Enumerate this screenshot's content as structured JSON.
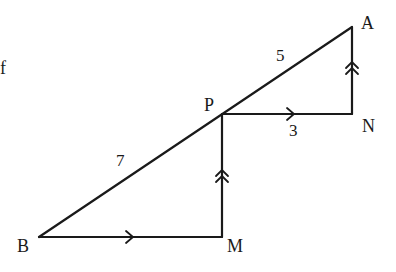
{
  "diagram": {
    "type": "geometry",
    "stroke_color": "#1a1a1a",
    "background": "#ffffff",
    "fragment_text": "f",
    "points": {
      "A": {
        "label": "A",
        "x": 352,
        "y": 27
      },
      "N": {
        "label": "N",
        "x": 352,
        "y": 114
      },
      "P": {
        "label": "P",
        "x": 222,
        "y": 114
      },
      "M": {
        "label": "M",
        "x": 222,
        "y": 237
      },
      "B": {
        "label": "B",
        "x": 39,
        "y": 237
      }
    },
    "segments": [
      {
        "from": "B",
        "to": "A",
        "desc": "line BA through P"
      },
      {
        "from": "P",
        "to": "N",
        "desc": "PN parallel to BM",
        "marker": "single-arrow"
      },
      {
        "from": "N",
        "to": "A",
        "desc": "NA parallel to MP",
        "marker": "double-arrow"
      },
      {
        "from": "M",
        "to": "P",
        "desc": "MP parallel to NA",
        "marker": "double-arrow"
      },
      {
        "from": "B",
        "to": "M",
        "desc": "BM parallel to PN",
        "marker": "single-arrow"
      }
    ],
    "lengths": {
      "AP": "5",
      "PN": "3",
      "PB": "7"
    }
  }
}
